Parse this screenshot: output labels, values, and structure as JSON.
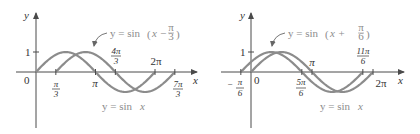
{
  "chart_data": [
    {
      "type": "line",
      "title": "",
      "xlabel": "x",
      "ylabel": "y",
      "series": [
        {
          "name": "y = sin x",
          "function": "sin(x)",
          "domain": [
            "0",
            "2π"
          ]
        },
        {
          "name": "y = sin(x − π/3)",
          "function": "sin(x - pi/3)",
          "domain": [
            "π/3",
            "7π/3"
          ]
        }
      ],
      "x_ticks": [
        "0",
        "π/3",
        "π",
        "4π/3",
        "2π",
        "7π/3"
      ],
      "y_ticks": [
        "1"
      ],
      "annotations": [
        "y = sin(x − π/3)",
        "y = sin x"
      ],
      "ylim": [
        -1,
        1
      ]
    },
    {
      "type": "line",
      "title": "",
      "xlabel": "x",
      "ylabel": "y",
      "series": [
        {
          "name": "y = sin x",
          "function": "sin(x)",
          "domain": [
            "0",
            "2π"
          ]
        },
        {
          "name": "y = sin(x + π/6)",
          "function": "sin(x + pi/6)",
          "domain": [
            "−π/6",
            "11π/6"
          ]
        }
      ],
      "x_ticks": [
        "−π/6",
        "0",
        "5π/6",
        "π",
        "11π/6",
        "2π"
      ],
      "y_ticks": [
        "1"
      ],
      "annotations": [
        "y = sin(x + π/6)",
        "y = sin x"
      ],
      "ylim": [
        -1,
        1
      ]
    }
  ],
  "left": {
    "ylabel": "y",
    "xlabel": "x",
    "origin": "0",
    "one": "1",
    "pi_over_3": {
      "num": "π",
      "den": "3"
    },
    "pi": "π",
    "four_pi_over_3": {
      "num": "4π",
      "den": "3"
    },
    "two_pi": "2π",
    "seven_pi_over_3": {
      "num": "7π",
      "den": "3"
    },
    "shifted_label_prefix": "y = sin",
    "shifted_label_inner": "x −",
    "shifted_frac": {
      "num": "π",
      "den": "3"
    },
    "base_label_prefix": "y = sin",
    "base_label_var": "x"
  },
  "right": {
    "ylabel": "y",
    "xlabel": "x",
    "origin": "0",
    "one": "1",
    "neg_pi_over_6": {
      "sign": "−",
      "num": "π",
      "den": "6"
    },
    "five_pi_over_6": {
      "num": "5π",
      "den": "6"
    },
    "pi": "π",
    "eleven_pi_over_6": {
      "num": "11π",
      "den": "6"
    },
    "two_pi": "2π",
    "shifted_label_prefix": "y = sin",
    "shifted_label_inner": "x +",
    "shifted_frac": {
      "num": "π",
      "den": "6"
    },
    "base_label_prefix": "y = sin",
    "base_label_var": "x"
  },
  "colors": {
    "axis": "#4a4a4a",
    "curve": "#8c8c8c",
    "text": "#333333",
    "annotation": "#8c8c8c"
  }
}
